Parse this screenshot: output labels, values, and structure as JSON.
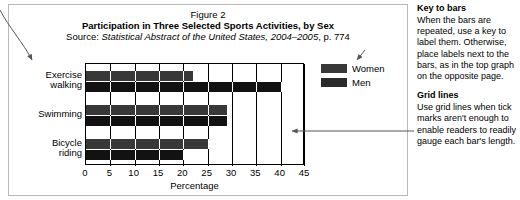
{
  "figure": {
    "number": "Figure 2",
    "title": "Participation in Three Selected Sports Activities, by Sex",
    "source_prefix": "Source: ",
    "source_italic": "Statistical Abstract of the United States, 2004–2005",
    "source_suffix": ", p. 774"
  },
  "chart_data": {
    "type": "bar",
    "orientation": "horizontal",
    "title": "Participation in Three Selected Sports Activities, by Sex",
    "categories": [
      "Exercise walking",
      "Swimming",
      "Bicycle riding"
    ],
    "series": [
      {
        "name": "Women",
        "values": [
          22,
          29,
          25
        ],
        "color": "#383838"
      },
      {
        "name": "Men",
        "values": [
          40,
          29,
          20
        ],
        "color": "#121212"
      }
    ],
    "xlabel": "Percentage",
    "ylabel": "",
    "xlim": [
      0,
      45
    ],
    "xticks": [
      0,
      5,
      10,
      15,
      20,
      25,
      30,
      35,
      40,
      45
    ],
    "xtick_labels": [
      "0",
      "5",
      "10",
      "15",
      "20",
      "25",
      "30",
      "35",
      "40",
      "45"
    ],
    "grid": true,
    "grid_axis": "x",
    "legend": [
      "Women",
      "Men"
    ],
    "legend_position": "right"
  },
  "legend": {
    "women_label": "Women",
    "men_label": "Men"
  },
  "axis": {
    "title": "Percentage"
  },
  "annotations": [
    {
      "heading": "Key to bars",
      "body": "When the bars are repeated, use a key to label them. Otherwise, place labels next to the bars, as in the top graph on the opposite page."
    },
    {
      "heading": "Grid lines",
      "body": "Use grid lines when tick marks aren't enough to enable readers to readily gauge each bar's length."
    }
  ]
}
